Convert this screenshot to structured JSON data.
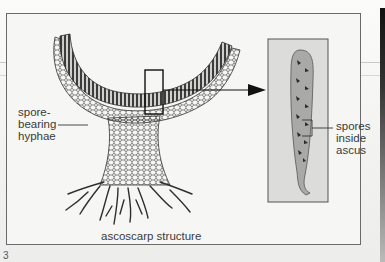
{
  "figure": {
    "number": "3",
    "caption": "ascoscarp structure",
    "labels": {
      "left": "spore-\nbearing\nhyphae",
      "right": "spores\ninside\nascus"
    }
  },
  "colors": {
    "frame": "#6a6a6a",
    "ascus_fill": "#a9a9a7",
    "inset_bg": "#dcdcda",
    "ink": "#2a2a2a",
    "text": "#3a3a3a"
  }
}
